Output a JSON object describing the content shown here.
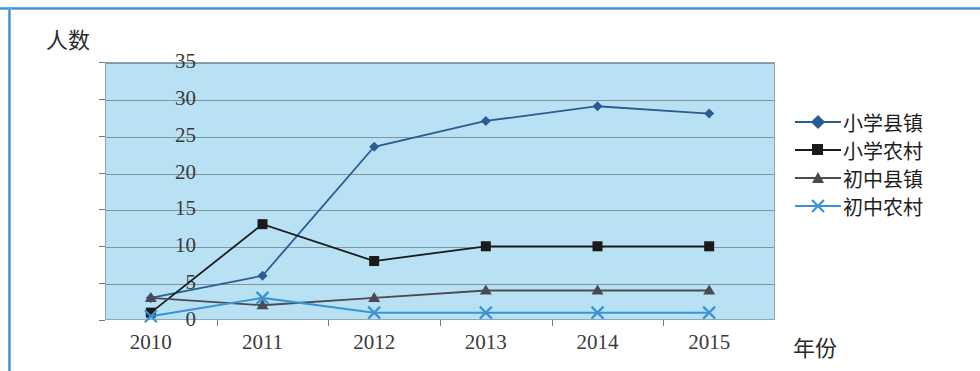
{
  "chart_data": {
    "type": "line",
    "title": "",
    "xlabel": "年份",
    "ylabel": "人数",
    "categories": [
      "2010",
      "2011",
      "2012",
      "2013",
      "2014",
      "2015"
    ],
    "x_tick_labels": [
      "2010",
      "2011",
      "2012",
      "2013",
      "2014",
      "2015"
    ],
    "y_tick_labels": [
      "0",
      "5",
      "10",
      "15",
      "20",
      "25",
      "30",
      "35"
    ],
    "y_ticks": [
      0,
      5,
      10,
      15,
      20,
      25,
      30,
      35
    ],
    "ylim": [
      0,
      35
    ],
    "grid": true,
    "legend_position": "right",
    "series": [
      {
        "name": "小学县镇",
        "marker": "diamond",
        "color": "#2a5c94",
        "values": [
          3,
          6,
          23.5,
          27,
          29,
          28
        ]
      },
      {
        "name": "小学农村",
        "marker": "square",
        "color": "#1a1a1a",
        "values": [
          1,
          13,
          8,
          10,
          10,
          10
        ]
      },
      {
        "name": "初中县镇",
        "marker": "triangle",
        "color": "#4a4a52",
        "values": [
          3,
          2,
          3,
          4,
          4,
          4
        ]
      },
      {
        "name": "初中农村",
        "marker": "x",
        "color": "#3b93d6",
        "values": [
          0.5,
          3,
          1,
          1,
          1,
          1
        ]
      }
    ]
  },
  "axis": {
    "y_title": "人数",
    "x_title": "年份"
  },
  "legend": {
    "items": [
      {
        "label": "小学县镇"
      },
      {
        "label": "小学农村"
      },
      {
        "label": "初中县镇"
      },
      {
        "label": "初中农村"
      }
    ]
  },
  "colors": {
    "plot_background": "#b8e2f3",
    "gridline": "#6d7b85",
    "frame_blue": "#3c8fd8",
    "series_primary": "#2a5c94",
    "series_secondary": "#1a1a1a",
    "series_tertiary": "#4a4a52",
    "series_quaternary": "#3b93d6"
  }
}
